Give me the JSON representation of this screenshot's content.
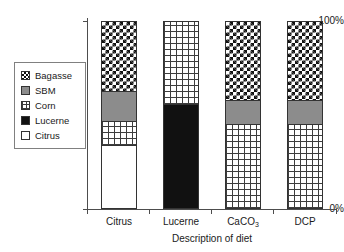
{
  "chart_data": {
    "type": "bar",
    "stacked": true,
    "normalized": true,
    "title": "",
    "subtitle": "",
    "xlabel": "Description of diet",
    "ylabel": "",
    "categories": [
      "Citrus",
      "Lucerne",
      "CaCO3",
      "DCP"
    ],
    "category_labels_display": [
      "Citrus",
      "Lucerne",
      "CaCO₃",
      "DCP"
    ],
    "ylim": [
      0,
      100
    ],
    "ytick_labels": [
      "0%",
      "100%"
    ],
    "ytick_values": [
      0,
      100
    ],
    "grid": false,
    "legend_position": "left-inside",
    "series": [
      {
        "name": "Bagasse",
        "pattern": "checkerboard",
        "values": [
          37,
          0,
          42,
          42
        ]
      },
      {
        "name": "SBM",
        "pattern": "solid-gray",
        "color": "#8c8c8c",
        "values": [
          16,
          0,
          13,
          13
        ]
      },
      {
        "name": "Corn",
        "pattern": "fine-grid",
        "values": [
          13,
          44,
          45,
          45
        ]
      },
      {
        "name": "Lucerne",
        "pattern": "solid-black",
        "color": "#111111",
        "values": [
          0,
          56,
          0,
          0
        ]
      },
      {
        "name": "Citrus",
        "pattern": "plain-white",
        "color": "#ffffff",
        "values": [
          34,
          0,
          0,
          0
        ]
      }
    ],
    "stack_order_top_to_bottom": [
      "Bagasse",
      "SBM",
      "Corn",
      "Lucerne",
      "Citrus"
    ]
  },
  "legend": {
    "items": [
      {
        "label": "Bagasse",
        "swatch": "bagasse-swatch-icon"
      },
      {
        "label": "SBM",
        "swatch": "sbm-swatch-icon"
      },
      {
        "label": "Corn",
        "swatch": "corn-swatch-icon"
      },
      {
        "label": "Lucerne",
        "swatch": "lucerne-swatch-icon"
      },
      {
        "label": "Citrus",
        "swatch": "citrus-swatch-icon"
      }
    ]
  },
  "axes": {
    "y_top_label": "100%",
    "y_bottom_label": "0%",
    "x_title": "Description of diet",
    "x_labels": {
      "citrus": "Citrus",
      "lucerne": "Lucerne",
      "caco3_main": "CaCO",
      "caco3_sub": "3",
      "dcp": "DCP"
    }
  },
  "colors": {
    "axis": "#4d4d4d",
    "outline": "#333333",
    "sbm_gray": "#8c8c8c",
    "lucerne_black": "#111111",
    "citrus_white": "#ffffff",
    "text": "#1a1a1a",
    "legend_border": "#808080"
  }
}
